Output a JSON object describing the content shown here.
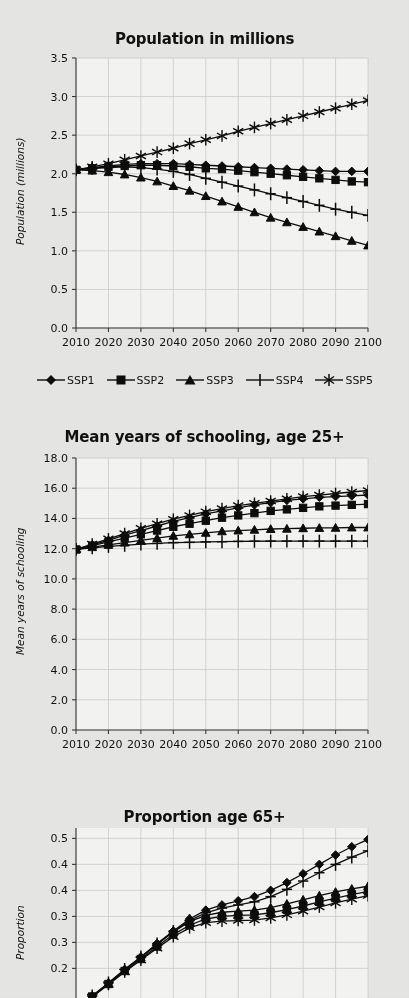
{
  "page": {
    "background": "#f1f1f0",
    "ink": "#0d0d0d",
    "grid_color": "#d6d6d6"
  },
  "legend": {
    "position": "below-first-chart",
    "items": [
      {
        "label": "SSP1",
        "marker": "diamond"
      },
      {
        "label": "SSP2",
        "marker": "square"
      },
      {
        "label": "SSP3",
        "marker": "triangle"
      },
      {
        "label": "SSP4",
        "marker": "plus"
      },
      {
        "label": "SSP5",
        "marker": "asterisk"
      }
    ]
  },
  "chart_data": [
    {
      "type": "line",
      "title": "Population in millions",
      "xlabel": "",
      "ylabel": "Population (millions)",
      "x": [
        2010,
        2015,
        2020,
        2025,
        2030,
        2035,
        2040,
        2045,
        2050,
        2055,
        2060,
        2065,
        2070,
        2075,
        2080,
        2085,
        2090,
        2095,
        2100
      ],
      "xticks": [
        2010,
        2020,
        2030,
        2040,
        2050,
        2060,
        2070,
        2080,
        2090,
        2100
      ],
      "yticks": [
        0.0,
        0.5,
        1.0,
        1.5,
        2.0,
        2.5,
        3.0,
        3.5
      ],
      "ytick_labels": [
        "0.0",
        "0.5",
        "1.0",
        "1.5",
        "2.0",
        "2.5",
        "3.0",
        "3.5"
      ],
      "ylim": [
        0.0,
        3.5
      ],
      "xlim": [
        2010,
        2100
      ],
      "grid": true,
      "series": [
        {
          "name": "SSP1",
          "marker": "diamond",
          "values": [
            2.05,
            2.08,
            2.1,
            2.12,
            2.13,
            2.13,
            2.13,
            2.12,
            2.11,
            2.1,
            2.09,
            2.08,
            2.07,
            2.06,
            2.05,
            2.04,
            2.03,
            2.03,
            2.03
          ]
        },
        {
          "name": "SSP2",
          "marker": "square",
          "values": [
            2.05,
            2.07,
            2.09,
            2.1,
            2.11,
            2.11,
            2.1,
            2.09,
            2.07,
            2.06,
            2.04,
            2.02,
            2.0,
            1.98,
            1.96,
            1.94,
            1.92,
            1.9,
            1.89
          ]
        },
        {
          "name": "SSP3",
          "marker": "triangle",
          "values": [
            2.05,
            2.04,
            2.02,
            1.99,
            1.95,
            1.9,
            1.84,
            1.78,
            1.71,
            1.64,
            1.57,
            1.5,
            1.43,
            1.37,
            1.31,
            1.25,
            1.19,
            1.13,
            1.07
          ]
        },
        {
          "name": "SSP4",
          "marker": "plus",
          "values": [
            2.05,
            2.07,
            2.08,
            2.09,
            2.08,
            2.06,
            2.03,
            1.99,
            1.94,
            1.89,
            1.84,
            1.79,
            1.74,
            1.69,
            1.64,
            1.59,
            1.54,
            1.5,
            1.46
          ]
        },
        {
          "name": "SSP5",
          "marker": "asterisk",
          "values": [
            2.05,
            2.09,
            2.13,
            2.18,
            2.23,
            2.28,
            2.33,
            2.39,
            2.44,
            2.49,
            2.55,
            2.6,
            2.65,
            2.7,
            2.75,
            2.8,
            2.85,
            2.9,
            2.95
          ]
        }
      ]
    },
    {
      "type": "line",
      "title": "Mean years of schooling, age 25+",
      "xlabel": "",
      "ylabel": "Mean years of schooling",
      "x": [
        2010,
        2015,
        2020,
        2025,
        2030,
        2035,
        2040,
        2045,
        2050,
        2055,
        2060,
        2065,
        2070,
        2075,
        2080,
        2085,
        2090,
        2095,
        2100
      ],
      "xticks": [
        2010,
        2020,
        2030,
        2040,
        2050,
        2060,
        2070,
        2080,
        2090,
        2100
      ],
      "yticks": [
        0.0,
        2.0,
        4.0,
        6.0,
        8.0,
        10.0,
        12.0,
        14.0,
        16.0,
        18.0
      ],
      "ytick_labels": [
        "0.0",
        "2.0",
        "4.0",
        "6.0",
        "8.0",
        "10.0",
        "12.0",
        "14.0",
        "16.0",
        "18.0"
      ],
      "ylim": [
        0.0,
        18.0
      ],
      "xlim": [
        2010,
        2100
      ],
      "grid": true,
      "series": [
        {
          "name": "SSP1",
          "marker": "diamond",
          "values": [
            11.95,
            12.25,
            12.55,
            12.9,
            13.2,
            13.5,
            13.8,
            14.05,
            14.3,
            14.5,
            14.7,
            14.9,
            15.05,
            15.2,
            15.3,
            15.4,
            15.45,
            15.5,
            15.55
          ]
        },
        {
          "name": "SSP2",
          "marker": "square",
          "values": [
            11.95,
            12.2,
            12.45,
            12.7,
            12.95,
            13.2,
            13.45,
            13.65,
            13.85,
            14.05,
            14.2,
            14.35,
            14.5,
            14.6,
            14.7,
            14.8,
            14.85,
            14.9,
            14.95
          ]
        },
        {
          "name": "SSP3",
          "marker": "triangle",
          "values": [
            11.95,
            12.1,
            12.25,
            12.4,
            12.55,
            12.7,
            12.85,
            12.95,
            13.05,
            13.15,
            13.2,
            13.25,
            13.3,
            13.32,
            13.35,
            13.37,
            13.38,
            13.4,
            13.4
          ]
        },
        {
          "name": "SSP4",
          "marker": "plus",
          "values": [
            11.95,
            12.05,
            12.15,
            12.22,
            12.3,
            12.35,
            12.4,
            12.42,
            12.45,
            12.46,
            12.48,
            12.49,
            12.5,
            12.5,
            12.5,
            12.5,
            12.5,
            12.5,
            12.5
          ]
        },
        {
          "name": "SSP5",
          "marker": "asterisk",
          "values": [
            11.95,
            12.3,
            12.65,
            13.0,
            13.35,
            13.65,
            13.95,
            14.2,
            14.45,
            14.65,
            14.85,
            15.0,
            15.15,
            15.3,
            15.45,
            15.55,
            15.65,
            15.75,
            15.85
          ]
        }
      ]
    },
    {
      "type": "line",
      "title": "Proportion age 65+",
      "xlabel": "",
      "ylabel": "Proportion",
      "x": [
        2010,
        2015,
        2020,
        2025,
        2030,
        2035,
        2040,
        2045,
        2050,
        2055,
        2060,
        2065,
        2070,
        2075,
        2080,
        2085,
        2090,
        2095,
        2100
      ],
      "xticks": [
        2010,
        2020,
        2030,
        2040,
        2050,
        2060,
        2070,
        2080,
        2090,
        2100
      ],
      "yticks": [
        0.25,
        0.3,
        0.35,
        0.4,
        0.45,
        0.5
      ],
      "ytick_labels": [
        "0.2",
        "0.3",
        "0.3",
        "0.4",
        "0.4",
        "0.5"
      ],
      "ylim": [
        0.17,
        0.52
      ],
      "xlim": [
        2010,
        2100
      ],
      "grid": true,
      "clipped_bottom": true,
      "series": [
        {
          "name": "SSP1",
          "marker": "diamond",
          "values": [
            0.175,
            0.197,
            0.222,
            0.248,
            0.272,
            0.298,
            0.322,
            0.345,
            0.362,
            0.372,
            0.38,
            0.388,
            0.4,
            0.415,
            0.432,
            0.45,
            0.468,
            0.484,
            0.498
          ]
        },
        {
          "name": "SSP2",
          "marker": "square",
          "values": [
            0.175,
            0.196,
            0.22,
            0.245,
            0.268,
            0.292,
            0.315,
            0.333,
            0.345,
            0.35,
            0.352,
            0.353,
            0.357,
            0.363,
            0.37,
            0.378,
            0.385,
            0.392,
            0.398
          ]
        },
        {
          "name": "SSP3",
          "marker": "triangle",
          "values": [
            0.175,
            0.196,
            0.221,
            0.247,
            0.271,
            0.296,
            0.32,
            0.34,
            0.352,
            0.358,
            0.36,
            0.362,
            0.367,
            0.374,
            0.382,
            0.39,
            0.397,
            0.403,
            0.408
          ]
        },
        {
          "name": "SSP4",
          "marker": "plus",
          "values": [
            0.175,
            0.197,
            0.222,
            0.248,
            0.272,
            0.297,
            0.321,
            0.342,
            0.357,
            0.366,
            0.372,
            0.378,
            0.388,
            0.402,
            0.418,
            0.434,
            0.45,
            0.464,
            0.476
          ]
        },
        {
          "name": "SSP5",
          "marker": "asterisk",
          "values": [
            0.175,
            0.195,
            0.219,
            0.243,
            0.266,
            0.289,
            0.311,
            0.328,
            0.338,
            0.341,
            0.342,
            0.343,
            0.347,
            0.353,
            0.36,
            0.368,
            0.376,
            0.383,
            0.39
          ]
        }
      ]
    }
  ]
}
